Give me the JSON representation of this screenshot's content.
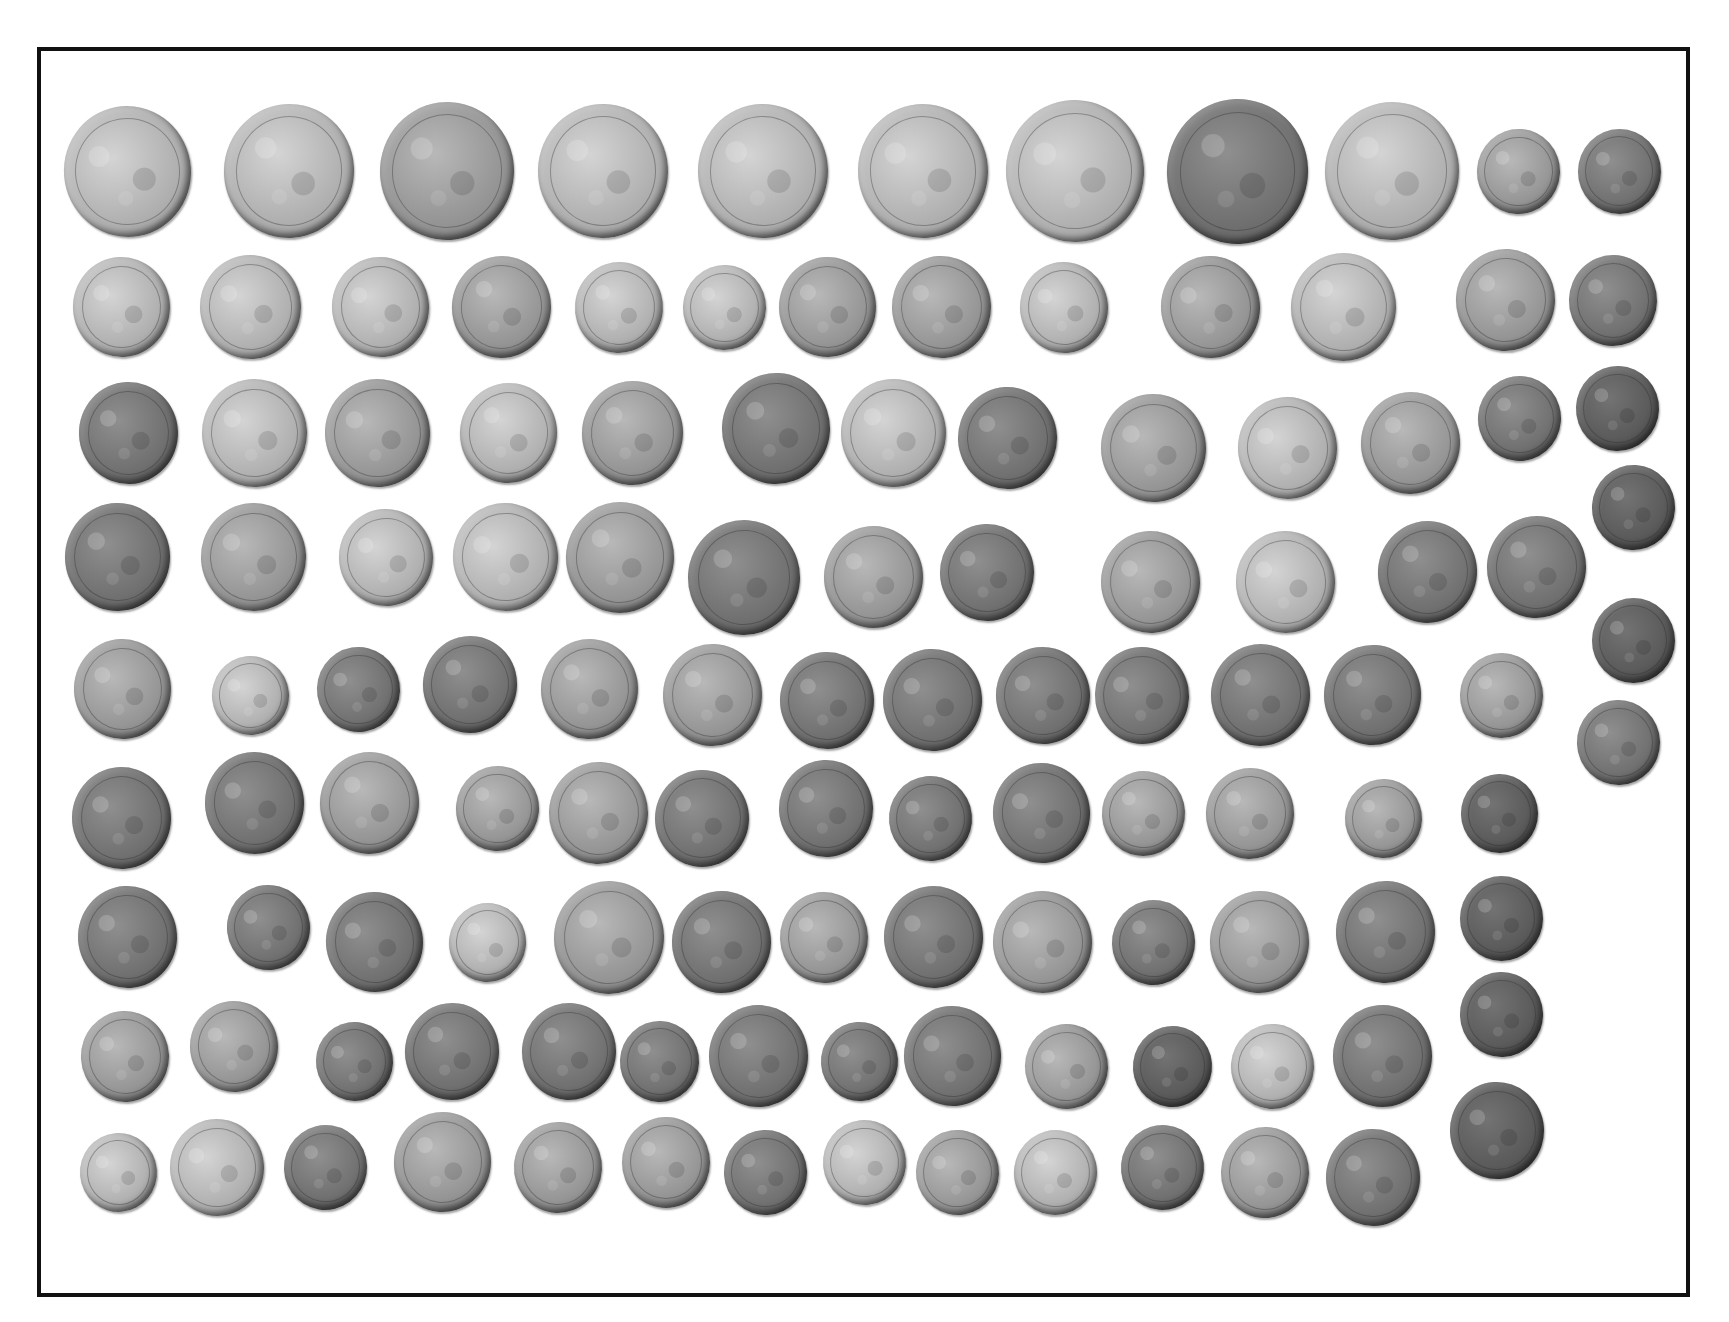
{
  "image": {
    "description": "Photograph of a hoard of worn silver coins arranged in rows inside a black rectangular frame",
    "frame_color": "#111111",
    "background_color": "#ffffff"
  },
  "coins": [
    {
      "x": 127,
      "y": 171,
      "d": 127,
      "tone": "l"
    },
    {
      "x": 289,
      "y": 171,
      "d": 130,
      "tone": "l"
    },
    {
      "x": 447,
      "y": 171,
      "d": 134,
      "tone": "m"
    },
    {
      "x": 603,
      "y": 171,
      "d": 130,
      "tone": "l"
    },
    {
      "x": 763,
      "y": 171,
      "d": 130,
      "tone": "l"
    },
    {
      "x": 923,
      "y": 171,
      "d": 130,
      "tone": "l"
    },
    {
      "x": 1075,
      "y": 171,
      "d": 138,
      "tone": "l"
    },
    {
      "x": 1237,
      "y": 171,
      "d": 141,
      "tone": "d"
    },
    {
      "x": 1392,
      "y": 171,
      "d": 134,
      "tone": "l"
    },
    {
      "x": 1518,
      "y": 171,
      "d": 83,
      "tone": "m"
    },
    {
      "x": 1619,
      "y": 171,
      "d": 83,
      "tone": "d"
    },
    {
      "x": 121,
      "y": 307,
      "d": 97,
      "tone": "l"
    },
    {
      "x": 250,
      "y": 307,
      "d": 101,
      "tone": "l"
    },
    {
      "x": 380,
      "y": 307,
      "d": 97,
      "tone": "l"
    },
    {
      "x": 501,
      "y": 307,
      "d": 99,
      "tone": "m"
    },
    {
      "x": 619,
      "y": 307,
      "d": 88,
      "tone": "l"
    },
    {
      "x": 724,
      "y": 307,
      "d": 83,
      "tone": "l"
    },
    {
      "x": 827,
      "y": 307,
      "d": 97,
      "tone": "m"
    },
    {
      "x": 941,
      "y": 307,
      "d": 99,
      "tone": "m"
    },
    {
      "x": 1064,
      "y": 307,
      "d": 88,
      "tone": "l"
    },
    {
      "x": 1210,
      "y": 307,
      "d": 99,
      "tone": "m"
    },
    {
      "x": 1343,
      "y": 307,
      "d": 105,
      "tone": "l"
    },
    {
      "x": 1505,
      "y": 300,
      "d": 99,
      "tone": "m"
    },
    {
      "x": 1613,
      "y": 300,
      "d": 88,
      "tone": "d"
    },
    {
      "x": 128,
      "y": 433,
      "d": 99,
      "tone": "d"
    },
    {
      "x": 254,
      "y": 433,
      "d": 105,
      "tone": "l"
    },
    {
      "x": 377,
      "y": 433,
      "d": 105,
      "tone": "m"
    },
    {
      "x": 508,
      "y": 433,
      "d": 97,
      "tone": "l"
    },
    {
      "x": 632,
      "y": 433,
      "d": 101,
      "tone": "m"
    },
    {
      "x": 776,
      "y": 428,
      "d": 108,
      "tone": "d"
    },
    {
      "x": 893,
      "y": 433,
      "d": 105,
      "tone": "l"
    },
    {
      "x": 1007,
      "y": 438,
      "d": 99,
      "tone": "d"
    },
    {
      "x": 1153,
      "y": 448,
      "d": 105,
      "tone": "m"
    },
    {
      "x": 1287,
      "y": 448,
      "d": 99,
      "tone": "l"
    },
    {
      "x": 1410,
      "y": 443,
      "d": 99,
      "tone": "m"
    },
    {
      "x": 1519,
      "y": 418,
      "d": 83,
      "tone": "d"
    },
    {
      "x": 1617,
      "y": 408,
      "d": 83,
      "tone": "x"
    },
    {
      "x": 117,
      "y": 557,
      "d": 105,
      "tone": "d"
    },
    {
      "x": 253,
      "y": 557,
      "d": 105,
      "tone": "m"
    },
    {
      "x": 386,
      "y": 557,
      "d": 94,
      "tone": "l"
    },
    {
      "x": 505,
      "y": 557,
      "d": 105,
      "tone": "l"
    },
    {
      "x": 620,
      "y": 557,
      "d": 108,
      "tone": "m"
    },
    {
      "x": 744,
      "y": 577,
      "d": 112,
      "tone": "d"
    },
    {
      "x": 873,
      "y": 577,
      "d": 99,
      "tone": "m"
    },
    {
      "x": 987,
      "y": 572,
      "d": 94,
      "tone": "d"
    },
    {
      "x": 1150,
      "y": 582,
      "d": 99,
      "tone": "m"
    },
    {
      "x": 1285,
      "y": 582,
      "d": 99,
      "tone": "l"
    },
    {
      "x": 1427,
      "y": 572,
      "d": 99,
      "tone": "d"
    },
    {
      "x": 1536,
      "y": 567,
      "d": 99,
      "tone": "d"
    },
    {
      "x": 1633,
      "y": 507,
      "d": 83,
      "tone": "x"
    },
    {
      "x": 1633,
      "y": 640,
      "d": 83,
      "tone": "x"
    },
    {
      "x": 122,
      "y": 689,
      "d": 97,
      "tone": "m"
    },
    {
      "x": 250,
      "y": 695,
      "d": 77,
      "tone": "l"
    },
    {
      "x": 358,
      "y": 689,
      "d": 83,
      "tone": "d"
    },
    {
      "x": 470,
      "y": 684,
      "d": 94,
      "tone": "d"
    },
    {
      "x": 589,
      "y": 689,
      "d": 97,
      "tone": "m"
    },
    {
      "x": 712,
      "y": 695,
      "d": 99,
      "tone": "m"
    },
    {
      "x": 827,
      "y": 700,
      "d": 94,
      "tone": "d"
    },
    {
      "x": 932,
      "y": 700,
      "d": 99,
      "tone": "d"
    },
    {
      "x": 1043,
      "y": 695,
      "d": 94,
      "tone": "d"
    },
    {
      "x": 1142,
      "y": 695,
      "d": 94,
      "tone": "d"
    },
    {
      "x": 1260,
      "y": 695,
      "d": 99,
      "tone": "d"
    },
    {
      "x": 1372,
      "y": 695,
      "d": 97,
      "tone": "d"
    },
    {
      "x": 1501,
      "y": 695,
      "d": 83,
      "tone": "m"
    },
    {
      "x": 1618,
      "y": 742,
      "d": 83,
      "tone": "d"
    },
    {
      "x": 121,
      "y": 818,
      "d": 99,
      "tone": "d"
    },
    {
      "x": 254,
      "y": 803,
      "d": 99,
      "tone": "d"
    },
    {
      "x": 369,
      "y": 803,
      "d": 99,
      "tone": "m"
    },
    {
      "x": 497,
      "y": 808,
      "d": 83,
      "tone": "m"
    },
    {
      "x": 598,
      "y": 813,
      "d": 99,
      "tone": "m"
    },
    {
      "x": 702,
      "y": 818,
      "d": 94,
      "tone": "d"
    },
    {
      "x": 826,
      "y": 808,
      "d": 94,
      "tone": "d"
    },
    {
      "x": 930,
      "y": 818,
      "d": 83,
      "tone": "d"
    },
    {
      "x": 1041,
      "y": 813,
      "d": 97,
      "tone": "d"
    },
    {
      "x": 1143,
      "y": 813,
      "d": 83,
      "tone": "m"
    },
    {
      "x": 1250,
      "y": 813,
      "d": 88,
      "tone": "m"
    },
    {
      "x": 1383,
      "y": 818,
      "d": 77,
      "tone": "m"
    },
    {
      "x": 1499,
      "y": 813,
      "d": 77,
      "tone": "x"
    },
    {
      "x": 127,
      "y": 937,
      "d": 99,
      "tone": "d"
    },
    {
      "x": 268,
      "y": 927,
      "d": 83,
      "tone": "d"
    },
    {
      "x": 374,
      "y": 942,
      "d": 97,
      "tone": "d"
    },
    {
      "x": 487,
      "y": 942,
      "d": 77,
      "tone": "l"
    },
    {
      "x": 609,
      "y": 937,
      "d": 110,
      "tone": "m"
    },
    {
      "x": 721,
      "y": 942,
      "d": 99,
      "tone": "d"
    },
    {
      "x": 824,
      "y": 937,
      "d": 88,
      "tone": "m"
    },
    {
      "x": 933,
      "y": 937,
      "d": 99,
      "tone": "d"
    },
    {
      "x": 1042,
      "y": 942,
      "d": 99,
      "tone": "m"
    },
    {
      "x": 1153,
      "y": 942,
      "d": 83,
      "tone": "d"
    },
    {
      "x": 1259,
      "y": 942,
      "d": 99,
      "tone": "m"
    },
    {
      "x": 1385,
      "y": 932,
      "d": 99,
      "tone": "d"
    },
    {
      "x": 1501,
      "y": 918,
      "d": 83,
      "tone": "x"
    },
    {
      "x": 125,
      "y": 1056,
      "d": 88,
      "tone": "m"
    },
    {
      "x": 234,
      "y": 1046,
      "d": 88,
      "tone": "m"
    },
    {
      "x": 354,
      "y": 1061,
      "d": 77,
      "tone": "d"
    },
    {
      "x": 452,
      "y": 1051,
      "d": 94,
      "tone": "d"
    },
    {
      "x": 569,
      "y": 1051,
      "d": 94,
      "tone": "d"
    },
    {
      "x": 659,
      "y": 1061,
      "d": 79,
      "tone": "d"
    },
    {
      "x": 758,
      "y": 1056,
      "d": 99,
      "tone": "d"
    },
    {
      "x": 859,
      "y": 1061,
      "d": 77,
      "tone": "d"
    },
    {
      "x": 952,
      "y": 1056,
      "d": 97,
      "tone": "d"
    },
    {
      "x": 1066,
      "y": 1066,
      "d": 83,
      "tone": "m"
    },
    {
      "x": 1172,
      "y": 1066,
      "d": 79,
      "tone": "x"
    },
    {
      "x": 1272,
      "y": 1066,
      "d": 83,
      "tone": "l"
    },
    {
      "x": 1382,
      "y": 1056,
      "d": 99,
      "tone": "d"
    },
    {
      "x": 1501,
      "y": 1014,
      "d": 83,
      "tone": "x"
    },
    {
      "x": 118,
      "y": 1172,
      "d": 77,
      "tone": "l"
    },
    {
      "x": 217,
      "y": 1167,
      "d": 94,
      "tone": "l"
    },
    {
      "x": 325,
      "y": 1167,
      "d": 83,
      "tone": "d"
    },
    {
      "x": 442,
      "y": 1162,
      "d": 97,
      "tone": "m"
    },
    {
      "x": 558,
      "y": 1167,
      "d": 88,
      "tone": "m"
    },
    {
      "x": 666,
      "y": 1162,
      "d": 88,
      "tone": "m"
    },
    {
      "x": 765,
      "y": 1172,
      "d": 83,
      "tone": "d"
    },
    {
      "x": 864,
      "y": 1162,
      "d": 83,
      "tone": "l"
    },
    {
      "x": 957,
      "y": 1172,
      "d": 83,
      "tone": "m"
    },
    {
      "x": 1055,
      "y": 1172,
      "d": 83,
      "tone": "l"
    },
    {
      "x": 1162,
      "y": 1167,
      "d": 83,
      "tone": "d"
    },
    {
      "x": 1265,
      "y": 1172,
      "d": 88,
      "tone": "m"
    },
    {
      "x": 1373,
      "y": 1177,
      "d": 94,
      "tone": "d"
    },
    {
      "x": 1497,
      "y": 1130,
      "d": 94,
      "tone": "x"
    }
  ]
}
